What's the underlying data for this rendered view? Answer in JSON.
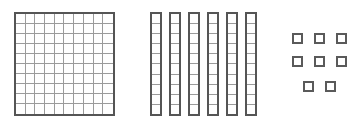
{
  "diagram": {
    "description": "Base-ten block representation showing one hundreds flat, six tens rods, and eight ones cubes.",
    "represented_number": "168",
    "background_color": "#ffffff",
    "outline_color": "#555555",
    "gridline_color": "#9a9a9a",
    "unit_outline_color": "#5a5a5a"
  },
  "groups": [
    {
      "name": "hundreds",
      "label": "Hundreds flat",
      "place_value": "100",
      "count": 1,
      "unit_value": 100,
      "total": 100,
      "grid_rows": 10,
      "grid_cols": 10,
      "small_squares": 100
    },
    {
      "name": "tens",
      "label": "Tens rods",
      "place_value": "10",
      "count": 6,
      "unit_value": 10,
      "total": 60,
      "cells_per_rod": 10,
      "small_squares": 60
    },
    {
      "name": "ones",
      "label": "Ones cubes",
      "place_value": "1",
      "count": 8,
      "unit_value": 1,
      "total": 8,
      "rows": [
        3,
        3,
        2
      ],
      "small_squares": 8
    }
  ],
  "totals": {
    "hundreds_digit": "1",
    "tens_digit": "6",
    "ones_digit": "8",
    "sum_label": "100 + 60 + 8 = 168"
  }
}
